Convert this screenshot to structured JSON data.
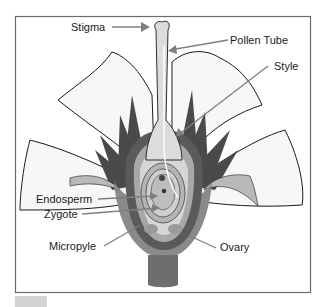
{
  "figure": {
    "colors": {
      "frame": "#6b6b6b",
      "petal_fill": "#f7f7f7",
      "petal_stroke": "#1a1a1a",
      "sepal_dark": "#4a4a4a",
      "ovary_outer": "#7a7a7a",
      "ovary_mid": "#a8a8a8",
      "style_fill": "#dcdcdc",
      "ovule_fill": "#cfcfcf",
      "leader_line": "#7f7f7f"
    }
  },
  "labels": {
    "stigma": "Stigma",
    "pollen_tube": "Pollen Tube",
    "style": "Style",
    "endosperm": "Endosperm",
    "zygote": "Zygote",
    "micropyle": "Micropyle",
    "ovary": "Ovary"
  }
}
